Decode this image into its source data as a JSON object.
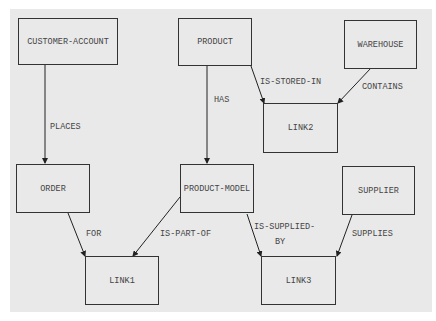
{
  "diagram": {
    "background": "#e9e9e9",
    "nodes": {
      "customer_account": "CUSTOMER-ACCOUNT",
      "product": "PRODUCT",
      "warehouse": "WAREHOUSE",
      "link2": "LINK2",
      "order": "ORDER",
      "product_model": "PRODUCT-MODEL",
      "supplier": "SUPPLIER",
      "link1": "LINK1",
      "link3": "LINK3"
    },
    "edges": {
      "places": "PLACES",
      "has": "HAS",
      "is_stored_in": "IS-STORED-IN",
      "contains": "CONTAINS",
      "for": "FOR",
      "is_part_of": "IS-PART-OF",
      "is_supplied_by_1": "IS-SUPPLIED-",
      "is_supplied_by_2": "BY",
      "supplies": "SUPPLIES"
    }
  }
}
